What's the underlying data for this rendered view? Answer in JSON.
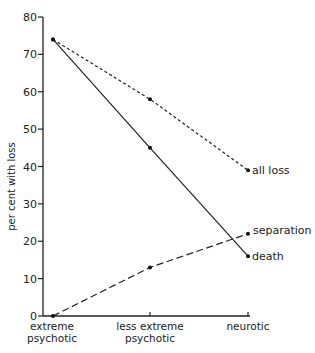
{
  "chart_data": {
    "type": "line",
    "title": "",
    "xlabel": "",
    "ylabel": "per cent with loss",
    "ylim": [
      0,
      80
    ],
    "yticks": [
      0,
      10,
      20,
      30,
      40,
      50,
      60,
      70,
      80
    ],
    "grid": false,
    "legend": "inline labels at right end of lines",
    "categories": [
      [
        "extreme",
        "psychotic"
      ],
      [
        "less extreme",
        "psychotic"
      ],
      [
        "neurotic"
      ]
    ],
    "series": [
      {
        "name": "all loss",
        "style": "short-dashed",
        "values": [
          74,
          58,
          39
        ]
      },
      {
        "name": "death",
        "style": "solid",
        "values": [
          74,
          45,
          16
        ]
      },
      {
        "name": "separation",
        "style": "long-dashed",
        "values": [
          0,
          13,
          22
        ]
      }
    ]
  }
}
